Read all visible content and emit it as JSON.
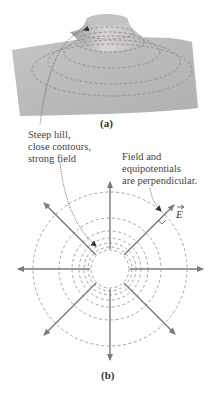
{
  "figure_a": {
    "caption": "(a)"
  },
  "figure_b": {
    "caption": "(b)",
    "field_label": "E"
  },
  "annotations": {
    "steep_hill": [
      "Steep hill,",
      "close contours,",
      "strong field"
    ],
    "perpendicular": [
      "Field and",
      "equipotentials",
      "are perpendicular."
    ]
  },
  "colors": {
    "surface": "#b3b3b3",
    "surface_light": "#cfcfcf",
    "contour_dash": "#9a8a8a",
    "arrow": "#7a7a7a",
    "leader": "#555555"
  }
}
